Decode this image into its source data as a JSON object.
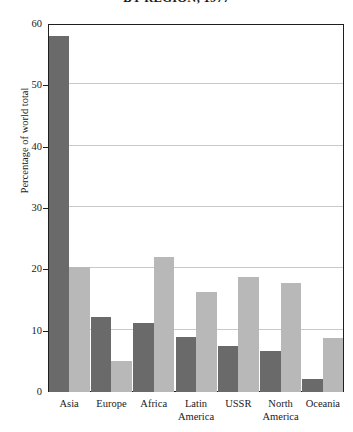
{
  "chart_data": {
    "type": "bar",
    "title": "BY REGION, 1977",
    "xlabel": "",
    "ylabel": "Percentage of world total",
    "ylim": [
      0,
      60
    ],
    "yticks": [
      0,
      10,
      20,
      30,
      40,
      50,
      60
    ],
    "grid": true,
    "legend": "none",
    "categories": [
      "Asia",
      "Europe",
      "Africa",
      "Latin America",
      "USSR",
      "North America",
      "Oceania"
    ],
    "category_lines": [
      [
        "Asia"
      ],
      [
        "Europe"
      ],
      [
        "Africa"
      ],
      [
        "Latin",
        "America"
      ],
      [
        "USSR"
      ],
      [
        "North",
        "America"
      ],
      [
        "Oceania"
      ]
    ],
    "series": [
      {
        "name": "dark",
        "color": "#6a6a6a",
        "values": [
          58.0,
          12.2,
          11.3,
          9.0,
          7.5,
          6.7,
          2.2
        ]
      },
      {
        "name": "light",
        "color": "#b8b8b8",
        "values": [
          20.4,
          5.0,
          22.0,
          16.3,
          18.7,
          17.8,
          8.8
        ]
      }
    ]
  },
  "axis": {
    "tick_labels": [
      "0",
      "10",
      "20",
      "30",
      "40",
      "50",
      "60"
    ]
  }
}
